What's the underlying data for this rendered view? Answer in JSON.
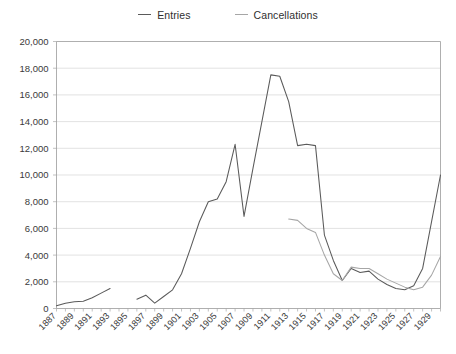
{
  "legend": {
    "position": "top-center",
    "items": [
      {
        "label": "Entries",
        "color": "#5a5a5a",
        "name": "legend-entries"
      },
      {
        "label": "Cancellations",
        "color": "#a6a6a6",
        "name": "legend-cancellations"
      }
    ]
  },
  "axes": {
    "y_ticks": [
      "0",
      "2,000",
      "4,000",
      "6,000",
      "8,000",
      "10,000",
      "12,000",
      "14,000",
      "16,000",
      "18,000",
      "20,000"
    ],
    "x_ticks": [
      "1887",
      "1889",
      "1891",
      "1893",
      "1895",
      "1897",
      "1899",
      "1901",
      "1903",
      "1905",
      "1907",
      "1909",
      "1911",
      "1913",
      "1915",
      "1917",
      "1919",
      "1921",
      "1923",
      "1925",
      "1927",
      "1929"
    ]
  },
  "chart_data": {
    "type": "line",
    "title": "",
    "xlabel": "",
    "ylabel": "",
    "ylim": [
      0,
      20000
    ],
    "xlim": [
      1887,
      1930
    ],
    "ytick_step": 2000,
    "grid": "horizontal",
    "legend_position": "top-center",
    "x": [
      1887,
      1888,
      1889,
      1890,
      1891,
      1892,
      1893,
      1894,
      1895,
      1896,
      1897,
      1898,
      1899,
      1900,
      1901,
      1902,
      1903,
      1904,
      1905,
      1906,
      1907,
      1908,
      1909,
      1910,
      1911,
      1912,
      1913,
      1914,
      1915,
      1916,
      1917,
      1918,
      1919,
      1920,
      1921,
      1922,
      1923,
      1924,
      1925,
      1926,
      1927,
      1928,
      1929,
      1930
    ],
    "series": [
      {
        "name": "Entries",
        "color": "#5a5a5a",
        "values": [
          200,
          400,
          500,
          550,
          800,
          1150,
          1500,
          null,
          null,
          700,
          1000,
          400,
          900,
          1400,
          2600,
          4500,
          6500,
          8000,
          8200,
          9500,
          12300,
          6900,
          10500,
          14000,
          17500,
          17400,
          15500,
          12200,
          12300,
          12200,
          5500,
          3600,
          2100,
          3000,
          2700,
          2800,
          2200,
          1800,
          1500,
          1400,
          1700,
          3000,
          6500,
          10000
        ]
      },
      {
        "name": "Cancellations",
        "color": "#a6a6a6",
        "values": [
          null,
          null,
          null,
          null,
          null,
          null,
          null,
          null,
          null,
          null,
          null,
          null,
          null,
          null,
          null,
          null,
          null,
          null,
          null,
          null,
          null,
          null,
          null,
          null,
          null,
          null,
          6700,
          6600,
          6000,
          5700,
          4000,
          2600,
          2100,
          3100,
          3000,
          3000,
          2600,
          2200,
          1900,
          1600,
          1400,
          1600,
          2500,
          3900
        ]
      }
    ]
  }
}
